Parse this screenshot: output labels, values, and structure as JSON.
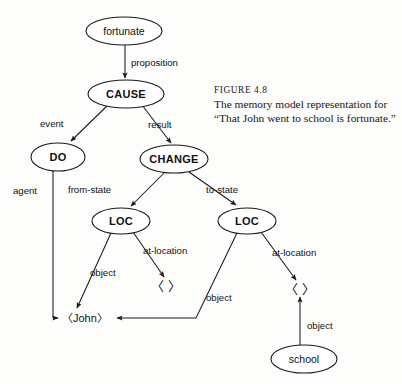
{
  "figure": {
    "caption_title": "FIGURE 4.8",
    "caption_body": "The memory model representation for “That John went to school is fortunate.”"
  },
  "diagram": {
    "type": "semantic-network-graph",
    "nodes": [
      {
        "id": "fortunate",
        "label": "fortunate",
        "shape": "ellipse",
        "style": "plain",
        "cx": 124,
        "cy": 31,
        "rx": 38,
        "ry": 14
      },
      {
        "id": "cause",
        "label": "CAUSE",
        "shape": "ellipse",
        "style": "bold",
        "cx": 126,
        "cy": 94,
        "rx": 38,
        "ry": 14
      },
      {
        "id": "do",
        "label": "DO",
        "shape": "ellipse",
        "style": "bold",
        "cx": 58,
        "cy": 157,
        "rx": 27,
        "ry": 14
      },
      {
        "id": "change",
        "label": "CHANGE",
        "shape": "ellipse",
        "style": "bold",
        "cx": 174,
        "cy": 159,
        "rx": 34,
        "ry": 14
      },
      {
        "id": "loc_from",
        "label": "LOC",
        "shape": "ellipse",
        "style": "bold",
        "cx": 121,
        "cy": 221,
        "rx": 29,
        "ry": 13
      },
      {
        "id": "loc_to",
        "label": "LOC",
        "shape": "ellipse",
        "style": "bold",
        "cx": 247,
        "cy": 221,
        "rx": 29,
        "ry": 13
      },
      {
        "id": "school",
        "label": "school",
        "shape": "ellipse",
        "style": "plain",
        "cx": 304,
        "cy": 359,
        "rx": 33,
        "ry": 14
      },
      {
        "id": "john",
        "label": "〈John〉",
        "shape": "token",
        "x": 62,
        "y": 318
      },
      {
        "id": "placeholder_left",
        "label": "〈    〉",
        "shape": "placeholder",
        "x": 166,
        "y": 286
      },
      {
        "id": "placeholder_right",
        "label": "〈    〉",
        "shape": "placeholder",
        "x": 300,
        "y": 289
      }
    ],
    "edges": [
      {
        "from": "fortunate",
        "to": "cause",
        "label": "proposition",
        "label_x": 131,
        "label_y": 62
      },
      {
        "from": "cause",
        "to": "do",
        "label": "event",
        "label_x": 56,
        "label_y": 123
      },
      {
        "from": "cause",
        "to": "change",
        "label": "result",
        "label_x": 148,
        "label_y": 124
      },
      {
        "from": "do",
        "to": "john",
        "label": "agent",
        "label_x": 16,
        "label_y": 190
      },
      {
        "from": "change",
        "to": "loc_from",
        "label": "from-state",
        "label_x": 90,
        "label_y": 189
      },
      {
        "from": "change",
        "to": "loc_to",
        "label": "to-state",
        "label_x": 212,
        "label_y": 189
      },
      {
        "from": "loc_from",
        "to": "john",
        "label": "object",
        "label_x": 92,
        "label_y": 272
      },
      {
        "from": "loc_from",
        "to": "placeholder_left",
        "label": "at-location",
        "label_x": 146,
        "label_y": 250
      },
      {
        "from": "loc_to",
        "to": "john",
        "label": "object",
        "label_x": 208,
        "label_y": 297
      },
      {
        "from": "loc_to",
        "to": "placeholder_right",
        "label": "at-location",
        "label_x": 275,
        "label_y": 252
      },
      {
        "from": "school",
        "to": "placeholder_right",
        "label": "object",
        "label_x": 308,
        "label_y": 325
      }
    ]
  }
}
